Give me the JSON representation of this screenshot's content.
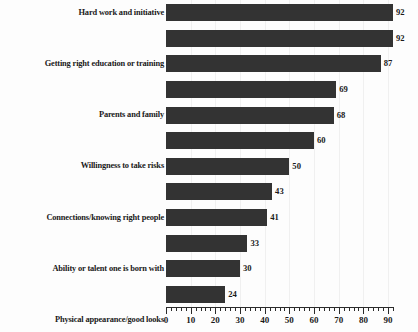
{
  "chart_data": {
    "type": "bar",
    "orientation": "horizontal",
    "title": "",
    "subtitle": "",
    "xlabel": "",
    "ylabel": "",
    "xlim": [
      0,
      95
    ],
    "grid": true,
    "legend": null,
    "bar_color": "#333333",
    "background_color": "#fdfdfd",
    "axis_color": "#2b2b2b",
    "text_color": "#1a1a1a",
    "tick_interval_major": 10,
    "tick_interval_minor": 2,
    "categories": [
      "Hard work and initiative",
      "Getting right education or training",
      "Parents and family",
      "Willingness to take risks",
      "Connections/knowing right people",
      "Ability or talent one is born with",
      "Physical appearance/good looks",
      "Good luck/in right place at right time",
      "Money inherited from family",
      "Gender",
      "Member of particular race/ethnic group",
      "Dishonesty and willingness to take\nwhatever one can get"
    ],
    "values": [
      92,
      92,
      87,
      69,
      68,
      60,
      50,
      43,
      41,
      33,
      30,
      24
    ],
    "value_labels": [
      "92",
      "92",
      "87",
      "69",
      "68",
      "60",
      "50",
      "43",
      "41",
      "33",
      "30",
      "24"
    ],
    "xtick_values": [
      0,
      10,
      20,
      30,
      40,
      50,
      60,
      70,
      80,
      90
    ],
    "xtick_labels": [
      "0",
      "10",
      "20",
      "30",
      "40",
      "50",
      "60",
      "70",
      "80",
      "90"
    ]
  }
}
